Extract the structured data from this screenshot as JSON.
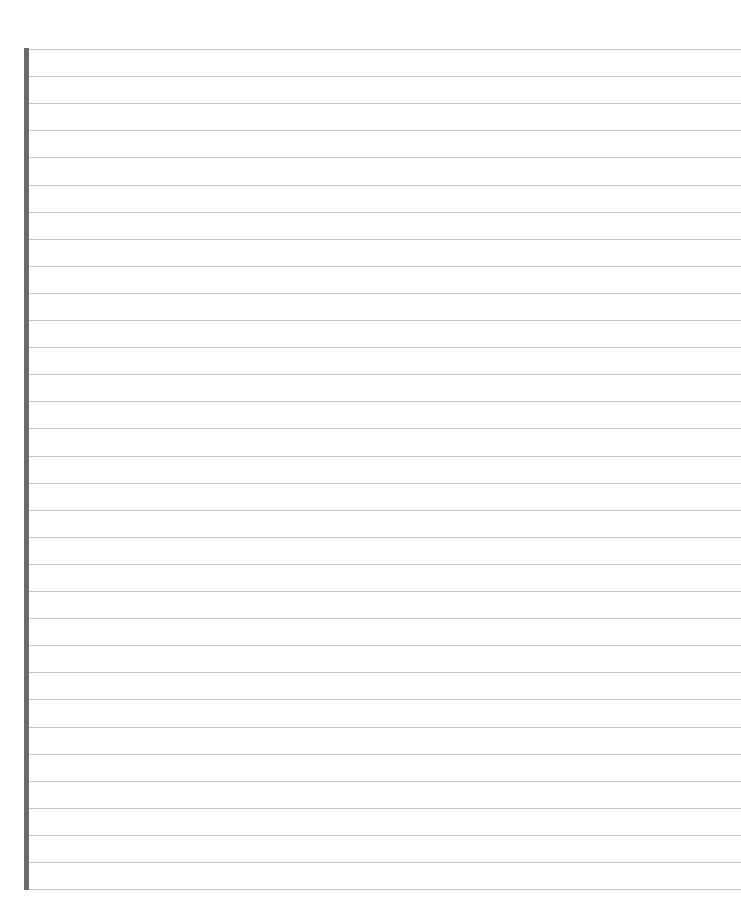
{
  "page": {
    "type": "lined-paper",
    "background_color": "#ffffff",
    "line_color": "#c6c6c6",
    "margin_bar_color": "#6b6b6b",
    "line_count": 32,
    "first_line_y": 49,
    "line_spacing": 27.1,
    "page_number": ""
  }
}
